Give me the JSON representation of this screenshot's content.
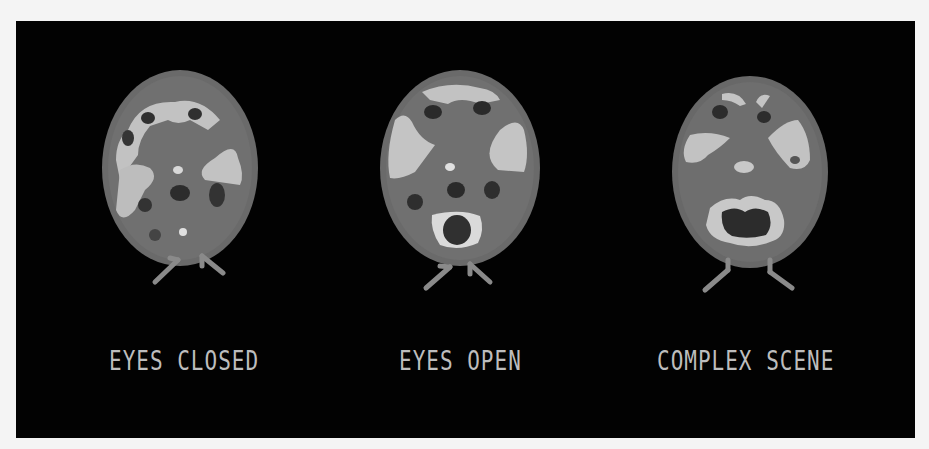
{
  "figure": {
    "panels": [
      {
        "id": "eyes-closed",
        "label": "EYES CLOSED"
      },
      {
        "id": "eyes-open",
        "label": "EYES OPEN"
      },
      {
        "id": "complex-scene",
        "label": "COMPLEX SCENE"
      }
    ],
    "colors": {
      "background": "#020202",
      "tissue_mid": "#6e6e6e",
      "tissue_high": "#c4c4c4",
      "tissue_low": "#2a2a2a",
      "label": "#bdbdbd"
    }
  }
}
